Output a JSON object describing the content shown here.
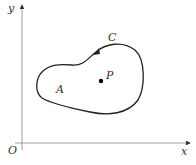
{
  "diagram": {
    "axes": {
      "x_label": "x",
      "y_label": "y",
      "origin_label": "O"
    },
    "curve_label": "C",
    "region_label": "A",
    "point_label": "P",
    "colors": {
      "axis": "#888888",
      "curve": "#222222",
      "point": "#000000",
      "text": "#333333"
    }
  }
}
